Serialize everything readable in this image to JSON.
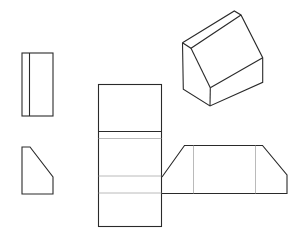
{
  "diagram": {
    "title": "",
    "colors": {
      "outline": "#2a2a2a",
      "fold_line": "#a8a8a8",
      "background": "#ffffff"
    },
    "views": [
      {
        "id": "top-view",
        "kind": "rect",
        "x": 22,
        "y": 53,
        "w": 31,
        "h": 63,
        "inner_line_x": 29.5
      },
      {
        "id": "side-view",
        "kind": "polygon",
        "points": [
          [
            22,
            147
          ],
          [
            30,
            147
          ],
          [
            53,
            177
          ],
          [
            53,
            194
          ],
          [
            22,
            194
          ]
        ]
      },
      {
        "id": "isometric-view",
        "kind": "isometric-block"
      },
      {
        "id": "net-vertical-strip",
        "kind": "rect",
        "x": 98.5,
        "y": 84.5,
        "w": 63,
        "h": 142,
        "dark_fold_y": 131.5,
        "light_fold_ys": [
          138.5,
          176,
          193
        ]
      },
      {
        "id": "net-horizontal-strip",
        "kind": "polygon",
        "points": [
          [
            162,
            177
          ],
          [
            184.5,
            145.5
          ],
          [
            262.5,
            145.5
          ],
          [
            287,
            175
          ],
          [
            287,
            193.5
          ],
          [
            162,
            193.5
          ]
        ],
        "light_fold_xs": [
          193.5,
          255.5
        ]
      }
    ]
  }
}
